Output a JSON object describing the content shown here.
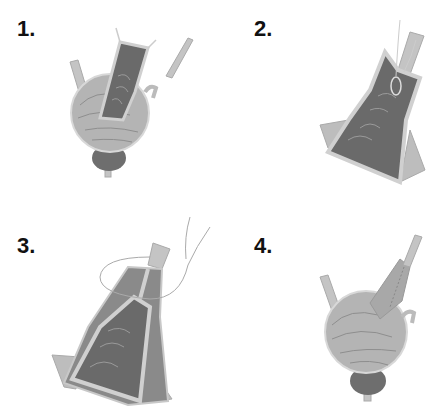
{
  "panels": [
    {
      "label": "1.",
      "description": "Bladder with incised anterior wall flap and separate ureteral stent"
    },
    {
      "label": "2.",
      "description": "Flap tubularized over catheter with sutures"
    },
    {
      "label": "3.",
      "description": "Tubularized flap closed with running suture"
    },
    {
      "label": "4.",
      "description": "Completed reconstruction attached to bladder"
    }
  ],
  "colors": {
    "bladder_fill": "#b4b4b4",
    "bladder_stroke": "#d8d8d8",
    "mucosa": "#6a6a6a",
    "edge_light": "#d0d0d0",
    "prostate": "#6e6e6e",
    "tube": "#c4c4c4",
    "suture": "#9a9a9a"
  }
}
